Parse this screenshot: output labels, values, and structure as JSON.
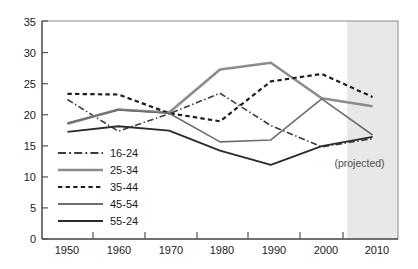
{
  "chart_data": {
    "type": "line",
    "title": "",
    "subtitle": "",
    "xlabel": "",
    "ylabel": "",
    "xlim": [
      1945,
      2015
    ],
    "ylim": [
      0,
      35
    ],
    "grid": false,
    "legend_position": "inside-bottom-left",
    "x_ticks": [
      "1950",
      "1960",
      "1970",
      "1980",
      "1990",
      "2000",
      "2010"
    ],
    "y_ticks": [
      "0",
      "5",
      "10",
      "15",
      "20",
      "25",
      "30",
      "35"
    ],
    "x": [
      1950,
      1960,
      1970,
      1980,
      1990,
      2000,
      2010
    ],
    "series": [
      {
        "name": "16-24",
        "label": "16-24",
        "style": "dash-dot",
        "color": "#3c3c3c",
        "width": 1.6,
        "values": [
          22.4,
          17.3,
          20.1,
          23.4,
          18.2,
          14.8,
          16.1
        ]
      },
      {
        "name": "25-34",
        "label": "25-34",
        "style": "solid",
        "color": "#8c8c8c",
        "width": 2.6,
        "values": [
          18.5,
          20.8,
          20.3,
          27.2,
          28.3,
          22.6,
          21.3
        ]
      },
      {
        "name": "35-44",
        "label": "35-44",
        "style": "dashed",
        "color": "#1f1f1f",
        "width": 2.2,
        "values": [
          23.3,
          23.2,
          20.2,
          18.9,
          25.3,
          26.5,
          22.8
        ]
      },
      {
        "name": "45-54",
        "label": "45-54",
        "style": "solid",
        "color": "#6e6e6e",
        "width": 1.6,
        "values": [
          18.6,
          20.7,
          20.2,
          15.6,
          15.9,
          22.5,
          16.7
        ]
      },
      {
        "name": "55-24",
        "label": "55-24",
        "style": "solid",
        "color": "#2b2b2b",
        "width": 1.8,
        "values": [
          17.2,
          18.1,
          17.4,
          14.2,
          11.9,
          14.9,
          16.4
        ]
      }
    ],
    "annotations": [
      {
        "name": "projected-label",
        "text": "(projected)",
        "x": 2008,
        "y": 11.6
      }
    ],
    "shaded_region": {
      "name": "projected-band",
      "from_x": 2005,
      "to_x": 2015,
      "color": "#e8e8e8"
    },
    "colors": {
      "axis": "#555555",
      "plot_border": "#777777",
      "text": "#1a1a1a",
      "shade": "#e8e8e8"
    }
  }
}
